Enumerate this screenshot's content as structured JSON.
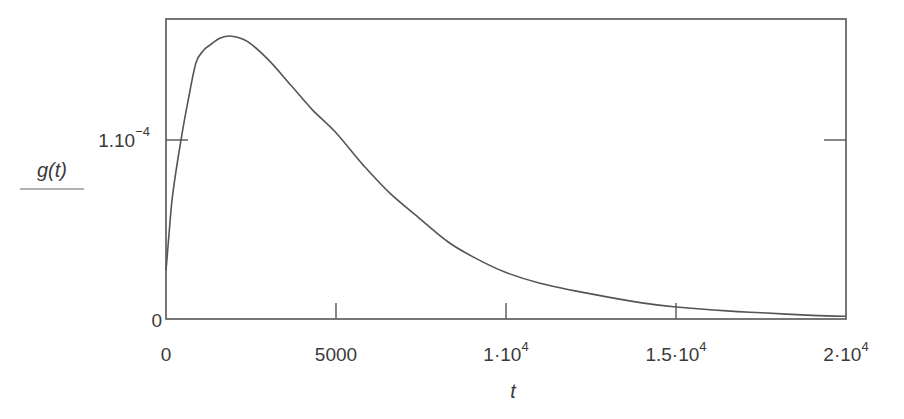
{
  "chart_data": {
    "type": "line",
    "title": "",
    "xlabel": "t",
    "ylabel": "g(t)",
    "xlim": [
      0,
      20000
    ],
    "ylim": [
      0,
      0.000159
    ],
    "grid": false,
    "legend": null,
    "x_ticks": [
      {
        "value": 0,
        "label": "0"
      },
      {
        "value": 5000,
        "label": "5000"
      },
      {
        "value": 10000,
        "label": "1·10",
        "exp": "4"
      },
      {
        "value": 15000,
        "label": "1.5·10",
        "exp": "4"
      },
      {
        "value": 20000,
        "label": "2·10",
        "exp": "4"
      }
    ],
    "y_ticks": [
      {
        "value": 0,
        "label": "0"
      },
      {
        "value": 0.0001,
        "label": "1.10",
        "exp": "−4"
      }
    ],
    "series": [
      {
        "name": "g(t)",
        "color": "#555555",
        "x": [
          0,
          100,
          200,
          440,
          650,
          880,
          1100,
          1290,
          1600,
          1940,
          2400,
          3000,
          3700,
          4300,
          5000,
          5800,
          6600,
          7470,
          8300,
          9100,
          10000,
          11000,
          12500,
          14000,
          15000,
          16500,
          17500,
          19000,
          20000
        ],
        "y": [
          2.7e-05,
          5e-05,
          7e-05,
          0.0001,
          0.000122,
          0.000143,
          0.00015,
          0.000153,
          0.000157,
          0.000158,
          0.000155,
          0.000145,
          0.00013,
          0.000117,
          0.000104,
          8.6e-05,
          7e-05,
          5.6e-05,
          4.3e-05,
          3.4e-05,
          2.6e-05,
          2e-05,
          1.4e-05,
          9e-06,
          6.7e-06,
          4.5e-06,
          3.5e-06,
          2e-06,
          1.5e-06
        ]
      }
    ]
  },
  "plot": {
    "x_axis_title": "t",
    "y_axis_title": "g(t)"
  }
}
